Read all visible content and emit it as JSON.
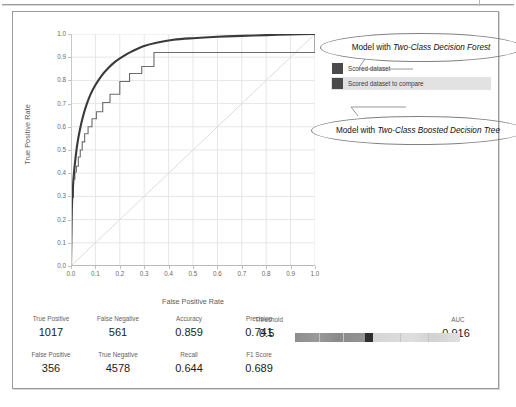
{
  "chart_data": {
    "type": "line",
    "title": "",
    "xlabel": "False Positive Rate",
    "ylabel": "True Positive Rate",
    "xlim": [
      0.0,
      1.0
    ],
    "ylim": [
      0.0,
      1.0
    ],
    "grid": true,
    "legend_position": "right",
    "x_ticks": [
      "0.0",
      "0.1",
      "0.2",
      "0.3",
      "0.4",
      "0.5",
      "0.6",
      "0.7",
      "0.8",
      "0.9",
      "1.0"
    ],
    "y_ticks": [
      "0.0",
      "0.1",
      "0.2",
      "0.3",
      "0.4",
      "0.5",
      "0.6",
      "0.7",
      "0.8",
      "0.9",
      "1.0"
    ],
    "series": [
      {
        "name": "Scored dataset",
        "annotation": "Model with Two-Class Decision Forest",
        "color": "#3a3a3a",
        "style": "smooth-thick",
        "x": [
          0.0,
          0.002,
          0.004,
          0.008,
          0.012,
          0.018,
          0.025,
          0.035,
          0.048,
          0.062,
          0.08,
          0.1,
          0.125,
          0.15,
          0.18,
          0.215,
          0.25,
          0.3,
          0.35,
          0.42,
          0.5,
          0.6,
          0.7,
          0.8,
          0.9,
          1.0
        ],
        "y": [
          0.0,
          0.15,
          0.265,
          0.34,
          0.4,
          0.46,
          0.52,
          0.58,
          0.64,
          0.69,
          0.74,
          0.78,
          0.82,
          0.85,
          0.88,
          0.905,
          0.925,
          0.948,
          0.962,
          0.975,
          0.982,
          0.988,
          0.992,
          0.995,
          0.998,
          1.0
        ]
      },
      {
        "name": "Scored dataset to compare",
        "annotation": "Model with Two-Class Boosted Decision Tree",
        "color": "#6b6b6b",
        "style": "step-thin",
        "x": [
          0.0,
          0.0,
          0.004,
          0.004,
          0.01,
          0.01,
          0.016,
          0.016,
          0.022,
          0.022,
          0.03,
          0.03,
          0.038,
          0.038,
          0.046,
          0.046,
          0.056,
          0.056,
          0.07,
          0.07,
          0.086,
          0.086,
          0.104,
          0.104,
          0.13,
          0.13,
          0.16,
          0.16,
          0.2,
          0.2,
          0.24,
          0.24,
          0.29,
          0.29,
          0.34,
          0.34,
          0.38,
          0.38,
          1.0,
          1.0
        ],
        "y": [
          0.0,
          0.26,
          0.26,
          0.295,
          0.295,
          0.375,
          0.375,
          0.405,
          0.405,
          0.43,
          0.43,
          0.47,
          0.47,
          0.5,
          0.5,
          0.535,
          0.535,
          0.57,
          0.57,
          0.6,
          0.6,
          0.635,
          0.635,
          0.665,
          0.665,
          0.705,
          0.705,
          0.74,
          0.74,
          0.795,
          0.795,
          0.83,
          0.83,
          0.86,
          0.86,
          0.92,
          0.92,
          0.92,
          0.92,
          1.0
        ]
      },
      {
        "name": "Random baseline",
        "color": "#dcdcdc",
        "style": "diagonal",
        "x": [
          0.0,
          1.0
        ],
        "y": [
          0.0,
          1.0
        ]
      }
    ]
  },
  "legend": {
    "items": [
      {
        "label": "Scored dataset",
        "color": "#4a4a4a",
        "highlighted": false
      },
      {
        "label": "Scored dataset to compare",
        "color": "#4a4a4a",
        "highlighted": true
      }
    ]
  },
  "callouts": [
    {
      "prefix": "Model with ",
      "emphasis": "Two-Class Decision Forest"
    },
    {
      "prefix": "Model with ",
      "emphasis": "Two-Class Boosted Decision Tree"
    }
  ],
  "metrics": {
    "row1": [
      {
        "label": "True Positive",
        "value": "1017"
      },
      {
        "label": "False Negative",
        "value": "561"
      },
      {
        "label": "Accuracy",
        "value": "0.859"
      },
      {
        "label": "Precision",
        "value": "0.741"
      }
    ],
    "row2": [
      {
        "label": "False Positive",
        "value": "356"
      },
      {
        "label": "True Negative",
        "value": "4578"
      },
      {
        "label": "Recall",
        "value": "0.644"
      },
      {
        "label": "F1 Score",
        "value": "0.689"
      }
    ],
    "threshold": {
      "label": "Threshold",
      "value": "0.5",
      "slider_position": 0.5
    },
    "auc": {
      "label": "AUC",
      "value": "0.916"
    }
  }
}
